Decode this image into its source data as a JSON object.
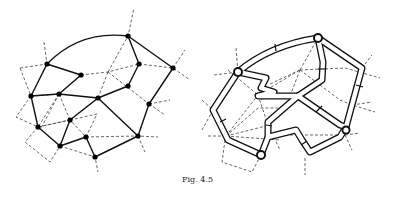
{
  "figure": {
    "caption": "Fig. 4.5",
    "left_panel": {
      "description": "Planar graph with black vertices (solid edges) overlaid with dashed dual graph",
      "nodes": [
        {
          "id": "A",
          "x": 47,
          "y": 64
        },
        {
          "id": "B",
          "x": 81,
          "y": 75
        },
        {
          "id": "C",
          "x": 31,
          "y": 96
        },
        {
          "id": "D",
          "x": 59,
          "y": 94
        },
        {
          "id": "E",
          "x": 98,
          "y": 98
        },
        {
          "id": "F",
          "x": 128,
          "y": 36
        },
        {
          "id": "G",
          "x": 139,
          "y": 64
        },
        {
          "id": "H",
          "x": 128,
          "y": 86
        },
        {
          "id": "I",
          "x": 173,
          "y": 68
        },
        {
          "id": "J",
          "x": 149,
          "y": 104
        },
        {
          "id": "K",
          "x": 70,
          "y": 120
        },
        {
          "id": "L",
          "x": 38,
          "y": 127
        },
        {
          "id": "M",
          "x": 60,
          "y": 146
        },
        {
          "id": "N",
          "x": 86,
          "y": 137
        },
        {
          "id": "O",
          "x": 95,
          "y": 157
        },
        {
          "id": "P",
          "x": 138,
          "y": 136
        }
      ]
    },
    "right_panel": {
      "description": "Thickened (ribbon/tube) version of the graph with dashed dual graph"
    }
  }
}
